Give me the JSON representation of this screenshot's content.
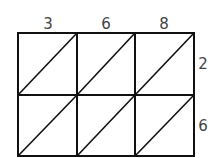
{
  "diagram": {
    "type": "lattice-multiplication-grid",
    "top_digits": [
      "3",
      "6",
      "8"
    ],
    "right_digits": [
      "2",
      "6"
    ],
    "rows": 2,
    "columns": 3,
    "line_color": "#111111",
    "label_color": "#444444"
  }
}
